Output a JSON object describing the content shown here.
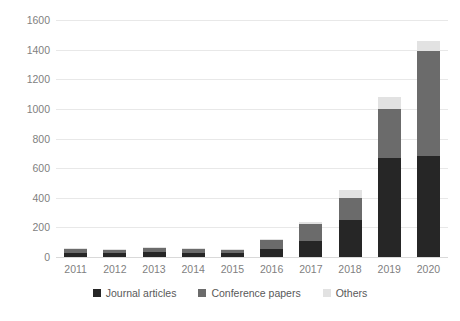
{
  "chart_data": {
    "type": "bar",
    "stacked": true,
    "title": "",
    "subtitle": "",
    "xlabel": "",
    "ylabel": "",
    "ylim": [
      0,
      1600
    ],
    "ytick_step": 200,
    "grid": true,
    "legend_position": "bottom",
    "categories": [
      "2011",
      "2012",
      "2013",
      "2014",
      "2015",
      "2016",
      "2017",
      "2018",
      "2019",
      "2020"
    ],
    "ytick_labels": [
      "0",
      "200",
      "400",
      "600",
      "800",
      "1000",
      "1200",
      "1400",
      "1600"
    ],
    "series": [
      {
        "name": "Journal articles",
        "color": "#262626",
        "values": [
          30,
          30,
          35,
          30,
          25,
          55,
          110,
          250,
          670,
          680
        ]
      },
      {
        "name": "Conference papers",
        "color": "#6b6b6b",
        "values": [
          25,
          20,
          25,
          25,
          25,
          60,
          110,
          150,
          330,
          710
        ]
      },
      {
        "name": "Others",
        "color": "#e2e2e2",
        "values": [
          5,
          5,
          5,
          5,
          5,
          10,
          15,
          50,
          80,
          70
        ]
      }
    ],
    "totals": [
      60,
      55,
      65,
      60,
      55,
      125,
      235,
      450,
      1080,
      1460
    ]
  },
  "legend": {
    "items": [
      {
        "label": "Journal articles",
        "color": "#262626"
      },
      {
        "label": "Conference papers",
        "color": "#6b6b6b"
      },
      {
        "label": "Others",
        "color": "#e2e2e2"
      }
    ]
  }
}
